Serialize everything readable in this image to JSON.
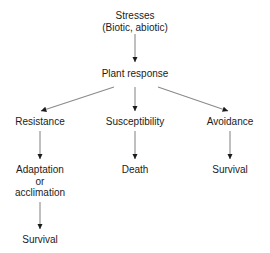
{
  "diagram": {
    "background_color": "#ffffff",
    "text_color": "#1b1b1b",
    "arrow_color": "#8a8a8a",
    "arrowhead_color": "#1b1b1b",
    "nodes": {
      "stresses": {
        "line1": "Stresses",
        "line2": "(Biotic, abiotic)"
      },
      "plant_response": {
        "label": "Plant response"
      },
      "resistance": {
        "label": "Resistance"
      },
      "susceptibility": {
        "label": "Susceptibility"
      },
      "avoidance": {
        "label": "Avoidance"
      },
      "adaptation": {
        "line1": "Adaptation",
        "line2": "or",
        "line3": "acclimation"
      },
      "death": {
        "label": "Death"
      },
      "survival_avoidance": {
        "label": "Survival"
      },
      "survival_resistance": {
        "label": "Survival"
      }
    },
    "edges": [
      {
        "name": "stresses-to-plant-response",
        "from": "stresses",
        "to": "plant_response"
      },
      {
        "name": "plant-response-to-resistance",
        "from": "plant_response",
        "to": "resistance"
      },
      {
        "name": "plant-response-to-susceptibility",
        "from": "plant_response",
        "to": "susceptibility"
      },
      {
        "name": "plant-response-to-avoidance",
        "from": "plant_response",
        "to": "avoidance"
      },
      {
        "name": "resistance-to-adaptation",
        "from": "resistance",
        "to": "adaptation"
      },
      {
        "name": "susceptibility-to-death",
        "from": "susceptibility",
        "to": "death"
      },
      {
        "name": "avoidance-to-survival",
        "from": "avoidance",
        "to": "survival_avoidance"
      },
      {
        "name": "adaptation-to-survival",
        "from": "adaptation",
        "to": "survival_resistance"
      }
    ]
  }
}
